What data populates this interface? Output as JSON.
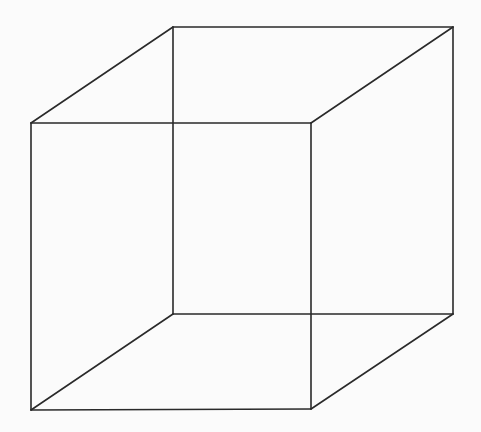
{
  "diagram": {
    "type": "necker-cube",
    "background": "#fbfbfb",
    "stroke_color": "#2a2a2a",
    "vertices": {
      "front_top_left": [
        31,
        123
      ],
      "front_top_right": [
        311,
        123
      ],
      "front_bottom_left": [
        31,
        410
      ],
      "front_bottom_right": [
        311,
        409
      ],
      "back_top_left": [
        173,
        27
      ],
      "back_top_right": [
        453,
        27
      ],
      "back_bottom_left": [
        173,
        314
      ],
      "back_bottom_right": [
        453,
        314
      ]
    },
    "edges": [
      [
        "front_top_left",
        "front_top_right"
      ],
      [
        "front_top_right",
        "front_bottom_right"
      ],
      [
        "front_bottom_right",
        "front_bottom_left"
      ],
      [
        "front_bottom_left",
        "front_top_left"
      ],
      [
        "back_top_left",
        "back_top_right"
      ],
      [
        "back_top_right",
        "back_bottom_right"
      ],
      [
        "back_bottom_right",
        "back_bottom_left"
      ],
      [
        "back_bottom_left",
        "back_top_left"
      ],
      [
        "front_top_left",
        "back_top_left"
      ],
      [
        "front_top_right",
        "back_top_right"
      ],
      [
        "front_bottom_left",
        "back_bottom_left"
      ],
      [
        "front_bottom_right",
        "back_bottom_right"
      ]
    ]
  }
}
